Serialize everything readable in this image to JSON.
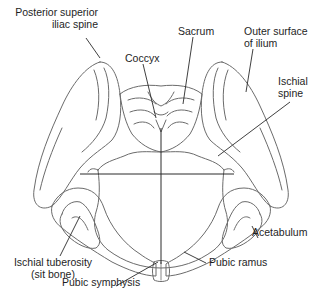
{
  "diagram": {
    "line_color": "#6b6b6b",
    "leader_color": "#2a2a2a",
    "labels": {
      "posterior_superior_iliac_spine": {
        "line1": "Posterior superior",
        "line2": "iliac spine"
      },
      "coccyx": {
        "line1": "Coccyx"
      },
      "sacrum": {
        "line1": "Sacrum"
      },
      "outer_surface_of_ilium": {
        "line1": "Outer surface",
        "line2": "of ilium"
      },
      "ischial_spine": {
        "line1": "Ischial",
        "line2": "spine"
      },
      "ischial_tuberosity": {
        "line1": "Ischial tuberosity",
        "line2": "(sit bone)"
      },
      "acetabulum": {
        "line1": "Acetabulum"
      },
      "pubic_ramus": {
        "line1": "Pubic ramus"
      },
      "pubic_symphysis": {
        "line1": "Pubic symphysis"
      }
    }
  }
}
